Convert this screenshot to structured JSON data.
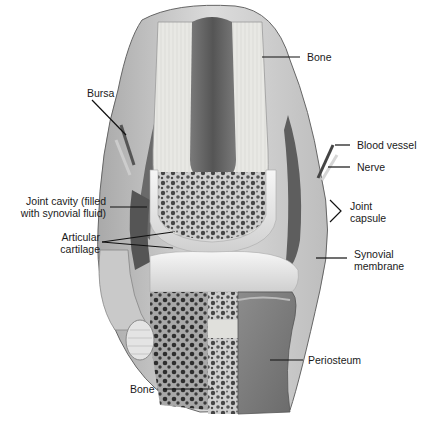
{
  "diagram": {
    "labels": {
      "bone_top": "Bone",
      "bursa": "Bursa",
      "blood_vessel": "Blood vessel",
      "nerve": "Nerve",
      "joint_cavity_line1": "Joint cavity (filled",
      "joint_cavity_line2": "with synovial fluid)",
      "joint_capsule_line1": "Joint",
      "joint_capsule_line2": "capsule",
      "articular_cartilage_line1": "Articular",
      "articular_cartilage_line2": "cartilage",
      "synovial_membrane_line1": "Synovial",
      "synovial_membrane_line2": "membrane",
      "periosteum": "Periosteum",
      "bone_bottom": "Bone"
    },
    "colors": {
      "background": "#ffffff",
      "compact_bone": "#e6e6e2",
      "marrow_cavity": "#6e6e6e",
      "spongy_bone": "#8a8a8a",
      "cartilage": "#efefef",
      "capsule": "#c8c8c8",
      "cavity": "#5a5a5a",
      "leader_line": "#111111"
    }
  }
}
